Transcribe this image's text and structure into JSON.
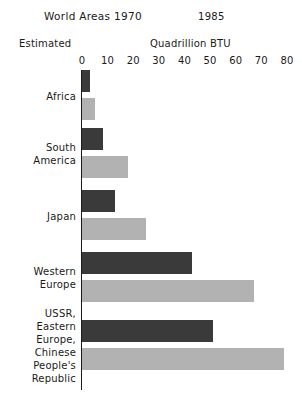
{
  "header": {
    "title": "World Areas 1970",
    "year_second": "1985",
    "estimated_note": "Estimated",
    "unit_label": "Quadrillion BTU"
  },
  "chart_data": {
    "type": "bar",
    "orientation": "horizontal",
    "title": "World Areas 1970",
    "subtitle": "1985",
    "xlabel": "Quadrillion BTU",
    "ylabel": "",
    "xlim": [
      0,
      80
    ],
    "xticks": [
      0,
      10,
      20,
      30,
      40,
      50,
      60,
      70,
      80
    ],
    "xtick_labels": [
      "0",
      "10",
      "20",
      "30",
      "40",
      "50",
      "60",
      "70",
      "80"
    ],
    "grid": false,
    "legend": "none",
    "categories": [
      "Africa",
      "South\nAmerica",
      "Japan",
      "Western\nEurope",
      "USSR,\nEastern\nEurope,\nChinese\nPeople's\nRepublic"
    ],
    "series": [
      {
        "name": "1970",
        "color": "#3a3a3a",
        "values": [
          3,
          8,
          13,
          43,
          51
        ]
      },
      {
        "name": "1985 Estimated",
        "color": "#b2b2b2",
        "values": [
          5,
          18,
          25,
          67,
          79
        ]
      }
    ]
  }
}
